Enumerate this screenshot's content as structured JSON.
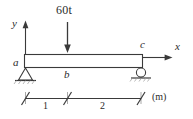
{
  "figure": {
    "type": "beam-free-body-diagram",
    "stroke_color": "#3a3a3a",
    "text_color": "#2b2b2b",
    "beam_fill": "#ffffff",
    "load": {
      "label": "60t",
      "direction": "down",
      "applied_at": "b"
    },
    "axes": {
      "y_label": "y",
      "x_label": "x"
    },
    "points": {
      "a": "a",
      "b": "b",
      "c": "c"
    },
    "supports": {
      "left": "pin-support",
      "right": "roller-support"
    },
    "dimensions": {
      "segments": [
        {
          "label": "1"
        },
        {
          "label": "2"
        }
      ],
      "unit": "(m)"
    }
  }
}
